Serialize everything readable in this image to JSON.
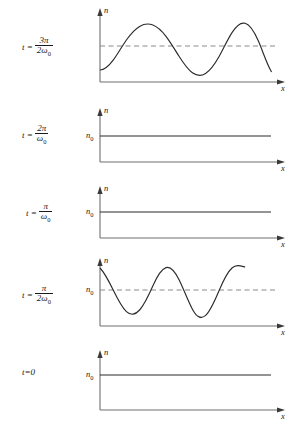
{
  "figure": {
    "axis_x_label": "x",
    "axis_y_label": "n",
    "baseline_label": "n0",
    "colors": {
      "curve": "#2b2b2b",
      "axis": "#6f6f6f",
      "dashed": "#8a8a8a",
      "background": "#ffffff"
    }
  },
  "panels": [
    {
      "id": "panel-1",
      "time_prefix": "t =",
      "time_numerator": "3π",
      "time_denominator": "2ω",
      "time_denominator_sub": "0",
      "time_text": "t = 3π/2ω0",
      "y_axis_label": "n",
      "x_axis_label": "x",
      "n0_label": "",
      "has_dashed_line": true,
      "waveform": "cosine",
      "phase": "trough-at-origin",
      "cycles": 2,
      "amplitude": 24,
      "mean_level": 42
    },
    {
      "id": "panel-2",
      "time_prefix": "t =",
      "time_numerator": "2π",
      "time_denominator": "ω",
      "time_denominator_sub": "0",
      "time_text": "t = 2π/ω0",
      "y_axis_label": "n",
      "x_axis_label": "x",
      "n0_label": "n0",
      "has_dashed_line": false,
      "waveform": "flat",
      "phase": "",
      "cycles": 0,
      "amplitude": 0,
      "mean_level": 42
    },
    {
      "id": "panel-3",
      "time_prefix": "t =",
      "time_numerator": "π",
      "time_denominator": "ω",
      "time_denominator_sub": "0",
      "time_text": "t = π/ω0",
      "y_axis_label": "n",
      "x_axis_label": "x",
      "n0_label": "n0",
      "has_dashed_line": false,
      "waveform": "flat",
      "phase": "",
      "cycles": 0,
      "amplitude": 0,
      "mean_level": 42
    },
    {
      "id": "panel-4",
      "time_prefix": "t =",
      "time_numerator": "π",
      "time_denominator": "2ω",
      "time_denominator_sub": "0",
      "time_text": "t = π/2ω0",
      "y_axis_label": "n",
      "x_axis_label": "x",
      "n0_label": "n0",
      "has_dashed_line": true,
      "waveform": "cosine",
      "phase": "peak-at-origin",
      "cycles": 2,
      "amplitude": 24,
      "mean_level": 42
    },
    {
      "id": "panel-5",
      "time_prefix": "t=0",
      "time_numerator": "",
      "time_denominator": "",
      "time_denominator_sub": "",
      "time_text": "t=0",
      "y_axis_label": "n",
      "x_axis_label": "x",
      "n0_label": "n0",
      "has_dashed_line": false,
      "waveform": "flat",
      "phase": "",
      "cycles": 0,
      "amplitude": 0,
      "mean_level": 42
    }
  ],
  "chart_data": {
    "type": "line",
    "title": "",
    "xlabel": "x",
    "ylabel": "n",
    "grid": false,
    "legend": false,
    "subplots": [
      {
        "name": "t = 3π/2ω0",
        "series": [
          {
            "name": "n(x)",
            "form": "n0 + A cos(kx + π)",
            "x": [
              0,
              0.125,
              0.25,
              0.375,
              0.5,
              0.625,
              0.75,
              0.875,
              1.0
            ],
            "y": [
              18,
              30,
              66,
              54,
              18,
              30,
              66,
              54,
              18
            ]
          },
          {
            "name": "n0 reference",
            "form": "dashed constant",
            "x": [
              0,
              1.0
            ],
            "y": [
              42,
              42
            ]
          }
        ]
      },
      {
        "name": "t = 2π/ω0",
        "series": [
          {
            "name": "n(x)",
            "form": "n0 constant",
            "x": [
              0,
              1.0
            ],
            "y": [
              42,
              42
            ]
          }
        ]
      },
      {
        "name": "t = π/ω0",
        "series": [
          {
            "name": "n(x)",
            "form": "n0 constant",
            "x": [
              0,
              1.0
            ],
            "y": [
              42,
              42
            ]
          }
        ]
      },
      {
        "name": "t = π/2ω0",
        "series": [
          {
            "name": "n(x)",
            "form": "n0 + A cos(kx)",
            "x": [
              0,
              0.125,
              0.25,
              0.375,
              0.5,
              0.625,
              0.75,
              0.875,
              1.0
            ],
            "y": [
              66,
              54,
              18,
              30,
              66,
              54,
              18,
              30,
              66
            ]
          },
          {
            "name": "n0 reference",
            "form": "dashed constant",
            "x": [
              0,
              1.0
            ],
            "y": [
              42,
              42
            ]
          }
        ]
      },
      {
        "name": "t=0",
        "series": [
          {
            "name": "n(x)",
            "form": "n0 constant",
            "x": [
              0,
              1.0
            ],
            "y": [
              42,
              42
            ]
          }
        ]
      }
    ]
  }
}
